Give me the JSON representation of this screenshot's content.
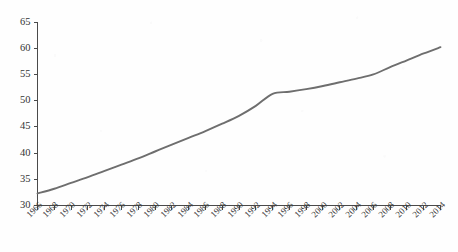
{
  "chart_data": {
    "type": "line",
    "title": "",
    "subtitle": "",
    "xlabel": "",
    "ylabel": "",
    "xlim": [
      1966,
      2014
    ],
    "ylim": [
      30,
      65
    ],
    "grid": false,
    "legend": false,
    "legend_position": "none",
    "line_color": "#6e6e6e",
    "axis_color": "#4a4a4a",
    "background_color": "#fefefe",
    "y_ticks": [
      30,
      35,
      40,
      45,
      50,
      55,
      60,
      65
    ],
    "y_tick_labels": [
      "30",
      "35",
      "40",
      "45",
      "50",
      "55",
      "60",
      "65"
    ],
    "x_ticks": [
      1966,
      1968,
      1970,
      1972,
      1974,
      1976,
      1978,
      1980,
      1982,
      1984,
      1986,
      1988,
      1990,
      1992,
      1994,
      1996,
      1998,
      2000,
      2002,
      2004,
      2006,
      2008,
      2010,
      2012,
      2014
    ],
    "x_tick_labels": [
      "1966",
      "1968",
      "1970",
      "1972",
      "1974",
      "1976",
      "1978",
      "1980",
      "1982",
      "1984",
      "1986",
      "1988",
      "1990",
      "1992",
      "1994",
      "1996",
      "1998",
      "2000",
      "2002",
      "2004",
      "2006",
      "2008",
      "2010",
      "2012",
      "2014"
    ],
    "x": [
      1966,
      1968,
      1970,
      1972,
      1974,
      1976,
      1978,
      1980,
      1982,
      1984,
      1986,
      1988,
      1990,
      1992,
      1994,
      1996,
      1998,
      2000,
      2002,
      2004,
      2006,
      2008,
      2010,
      2012,
      2014
    ],
    "values": [
      32.3,
      33.2,
      34.3,
      35.4,
      36.6,
      37.8,
      39.0,
      40.3,
      41.6,
      42.9,
      44.2,
      45.6,
      47.1,
      49.0,
      51.3,
      51.7,
      52.2,
      52.8,
      53.5,
      54.2,
      55.0,
      56.4,
      57.7,
      59.0,
      60.2
    ],
    "series": [
      {
        "name": "series-1",
        "color": "#6e6e6e",
        "values": [
          32.3,
          33.2,
          34.3,
          35.4,
          36.6,
          37.8,
          39.0,
          40.3,
          41.6,
          42.9,
          44.2,
          45.6,
          47.1,
          49.0,
          51.3,
          51.7,
          52.2,
          52.8,
          53.5,
          54.2,
          55.0,
          56.4,
          57.7,
          59.0,
          60.2
        ]
      }
    ],
    "annotations": []
  }
}
